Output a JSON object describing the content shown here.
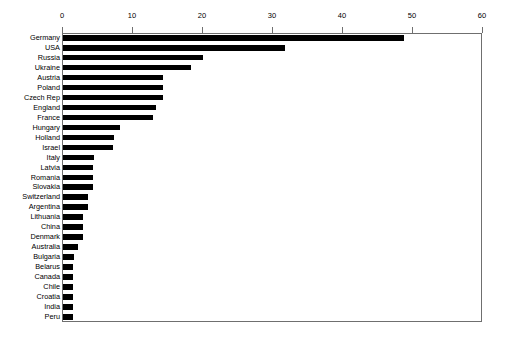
{
  "chart_data": {
    "type": "bar",
    "orientation": "horizontal",
    "title": "",
    "subtitle": "",
    "xlabel": "",
    "ylabel": "",
    "xlim": [
      0,
      60
    ],
    "ylim": null,
    "grid": false,
    "legend": null,
    "legend_position": "none",
    "axis_position": "top",
    "xticks": [
      0,
      10,
      20,
      30,
      40,
      50,
      60
    ],
    "xtick_labels": [
      "0",
      "10",
      "20",
      "30",
      "40",
      "50",
      "60"
    ],
    "bar_color": "#000000",
    "categories": [
      "Germany",
      "USA",
      "Russia",
      "Ukraine",
      "Austria",
      "Poland",
      "Czech Rep",
      "England",
      "France",
      "Hungary",
      "Holland",
      "Israel",
      "Italy",
      "Latvia",
      "Romania",
      "Slovakia",
      "Switzerland",
      "Argentina",
      "Lithuania",
      "China",
      "Denmark",
      "Australia",
      "Bulgaria",
      "Belarus",
      "Canada",
      "Chile",
      "Croatia",
      "India",
      "Peru"
    ],
    "values": [
      48.7,
      31.7,
      20.0,
      18.3,
      14.3,
      14.3,
      14.3,
      13.3,
      12.9,
      8.1,
      7.3,
      7.1,
      4.4,
      4.3,
      4.3,
      4.3,
      3.6,
      3.6,
      2.9,
      2.9,
      2.9,
      2.2,
      1.5,
      1.4,
      1.4,
      1.4,
      1.4,
      1.4,
      1.4
    ],
    "points": [
      {
        "category": "Germany",
        "value": 48.7
      },
      {
        "category": "USA",
        "value": 31.7
      },
      {
        "category": "Russia",
        "value": 20.0
      },
      {
        "category": "Ukraine",
        "value": 18.3
      },
      {
        "category": "Austria",
        "value": 14.3
      },
      {
        "category": "Poland",
        "value": 14.3
      },
      {
        "category": "Czech Rep",
        "value": 14.3
      },
      {
        "category": "England",
        "value": 13.3
      },
      {
        "category": "France",
        "value": 12.9
      },
      {
        "category": "Hungary",
        "value": 8.1
      },
      {
        "category": "Holland",
        "value": 7.3
      },
      {
        "category": "Israel",
        "value": 7.1
      },
      {
        "category": "Italy",
        "value": 4.4
      },
      {
        "category": "Latvia",
        "value": 4.3
      },
      {
        "category": "Romania",
        "value": 4.3
      },
      {
        "category": "Slovakia",
        "value": 4.3
      },
      {
        "category": "Switzerland",
        "value": 3.6
      },
      {
        "category": "Argentina",
        "value": 3.6
      },
      {
        "category": "Lithuania",
        "value": 2.9
      },
      {
        "category": "China",
        "value": 2.9
      },
      {
        "category": "Denmark",
        "value": 2.9
      },
      {
        "category": "Australia",
        "value": 2.2
      },
      {
        "category": "Bulgaria",
        "value": 1.5
      },
      {
        "category": "Belarus",
        "value": 1.4
      },
      {
        "category": "Canada",
        "value": 1.4
      },
      {
        "category": "Chile",
        "value": 1.4
      },
      {
        "category": "Croatia",
        "value": 1.4
      },
      {
        "category": "India",
        "value": 1.4
      },
      {
        "category": "Peru",
        "value": 1.4
      }
    ]
  }
}
